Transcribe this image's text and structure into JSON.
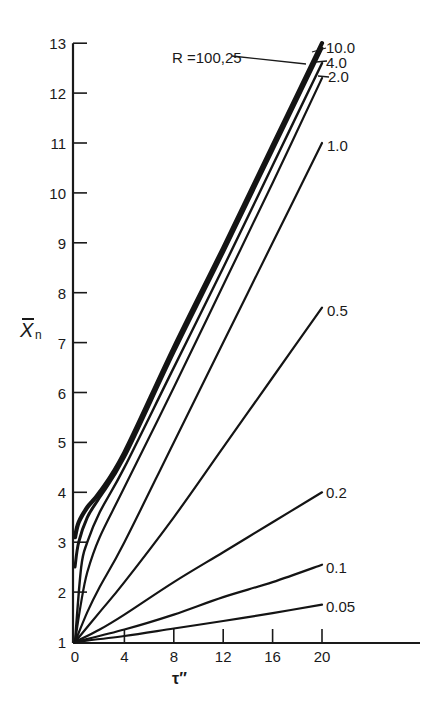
{
  "chart_data": {
    "type": "line",
    "title": "",
    "xlabel": "τ″",
    "ylabel": "X̄n",
    "ylabel_main": "X",
    "ylabel_sub": "n",
    "xlim": [
      0,
      28
    ],
    "ylim": [
      1,
      13
    ],
    "x_ticks": [
      0,
      4,
      8,
      12,
      16,
      20
    ],
    "x_tick_labels": [
      "0",
      "4",
      "8",
      "12",
      "16",
      "20"
    ],
    "y_ticks": [
      1,
      2,
      3,
      4,
      5,
      6,
      7,
      8,
      9,
      10,
      11,
      12,
      13
    ],
    "y_tick_labels": [
      "1",
      "2",
      "3",
      "4",
      "5",
      "6",
      "7",
      "8",
      "9",
      "10",
      "11",
      "12",
      "13"
    ],
    "grid": false,
    "legend": "inline labels at curve ends",
    "series": [
      {
        "name": "R=100,25",
        "label": "R =100,25",
        "x": [
          0,
          0.3,
          1,
          2,
          4,
          8,
          12,
          16,
          20
        ],
        "y": [
          3.1,
          3.4,
          3.7,
          4.0,
          4.8,
          6.9,
          8.9,
          10.95,
          13.0
        ]
      },
      {
        "name": "10.0",
        "label": "10.0",
        "x": [
          0,
          0.3,
          1,
          2,
          4,
          8,
          12,
          16,
          20
        ],
        "y": [
          2.5,
          3.0,
          3.5,
          3.9,
          4.7,
          6.8,
          8.8,
          10.85,
          12.9
        ]
      },
      {
        "name": "4.0",
        "label": "4.0",
        "x": [
          0,
          0.5,
          1,
          2,
          4,
          8,
          12,
          16,
          20
        ],
        "y": [
          1.0,
          2.5,
          3.0,
          3.6,
          4.5,
          6.5,
          8.5,
          10.55,
          12.6
        ]
      },
      {
        "name": "2.0",
        "label": "2.0",
        "x": [
          0,
          0.5,
          1,
          2,
          4,
          8,
          12,
          16,
          20
        ],
        "y": [
          1.0,
          1.8,
          2.4,
          3.1,
          4.1,
          6.1,
          8.15,
          10.2,
          12.3
        ]
      },
      {
        "name": "1.0",
        "label": "1.0",
        "x": [
          0,
          1,
          2,
          4,
          8,
          12,
          16,
          20
        ],
        "y": [
          1.0,
          1.6,
          2.1,
          3.0,
          5.0,
          7.0,
          9.0,
          11.0
        ]
      },
      {
        "name": "0.5",
        "label": "0.5",
        "x": [
          0,
          2,
          4,
          8,
          12,
          16,
          20
        ],
        "y": [
          1.0,
          1.6,
          2.2,
          3.5,
          4.9,
          6.3,
          7.7
        ]
      },
      {
        "name": "0.2",
        "label": "0.2",
        "x": [
          0,
          2,
          4,
          8,
          12,
          16,
          20
        ],
        "y": [
          1.0,
          1.25,
          1.55,
          2.2,
          2.8,
          3.4,
          4.0
        ]
      },
      {
        "name": "0.1",
        "label": "0.1",
        "x": [
          0,
          4,
          8,
          12,
          16,
          20
        ],
        "y": [
          1.0,
          1.25,
          1.55,
          1.9,
          2.2,
          2.55
        ]
      },
      {
        "name": "0.05",
        "label": "0.05",
        "x": [
          0,
          4,
          8,
          12,
          16,
          20
        ],
        "y": [
          1.0,
          1.12,
          1.27,
          1.42,
          1.58,
          1.75
        ]
      }
    ]
  },
  "labels": {
    "x_axis_title": "τ″",
    "y_axis_title_main": "X",
    "y_axis_title_sub": "n"
  }
}
